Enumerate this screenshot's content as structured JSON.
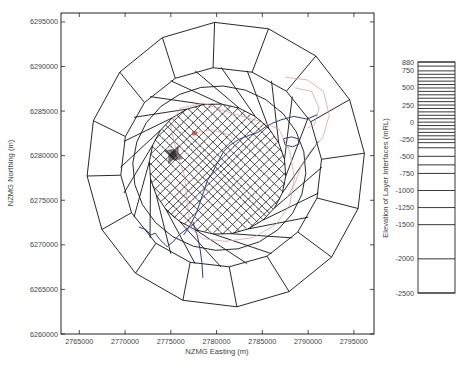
{
  "chart_data": [
    {
      "type": "mesh-map",
      "title": "",
      "xlabel": "NZMG Easting (m)",
      "ylabel": "NZMG Northing (m)",
      "xlim": [
        2763000,
        2797200
      ],
      "ylim": [
        6260000,
        6296000
      ],
      "xticks": [
        2765000,
        2770000,
        2775000,
        2780000,
        2785000,
        2790000,
        2795000
      ],
      "xtick_labels": [
        "2765000",
        "2770000",
        "2775000",
        "2780000",
        "2785000",
        "2790000",
        "2795000"
      ],
      "yticks": [
        6260000,
        6265000,
        6270000,
        6275000,
        6280000,
        6285000,
        6290000,
        6295000
      ],
      "ytick_labels": [
        "6260000",
        "6265000",
        "6270000",
        "6275000",
        "6280000",
        "6285000",
        "6290000",
        "6295000"
      ],
      "grid": false,
      "mesh": {
        "description": "Finite-element mesh: radial/elliptical rings of quadrilateral elements refining toward a central elongated zone",
        "center": [
          2781000,
          6277500
        ],
        "ellipse_rings": [
          {
            "rx": 15200,
            "ry": 16000,
            "rotation_deg": 0,
            "dx": 0,
            "dy": 1500
          },
          {
            "rx": 11000,
            "ry": 11200,
            "rotation_deg": 0,
            "dx": -500,
            "dy": 1200
          },
          {
            "rx": 7600,
            "ry": 7200,
            "rotation_deg": -35,
            "dx": -900,
            "dy": 1000
          },
          {
            "rx": 6200,
            "ry": 5000,
            "rotation_deg": -40,
            "dx": -600,
            "dy": 600
          }
        ],
        "outer_radial_spokes": 16,
        "inner_grid_divisions": 22,
        "refinement_spots": [
          {
            "x": 2775300,
            "y": 6280100,
            "label": "dense-cluster"
          }
        ]
      },
      "overlays": [
        {
          "name": "rivers",
          "color": "#2c3a8c",
          "paths": [
            [
              [
                2787000,
                6284000
              ],
              [
                2786000,
                6283600
              ],
              [
                2785300,
                6283200
              ],
              [
                2784500,
                6282600
              ],
              [
                2783600,
                6282300
              ],
              [
                2782400,
                6281800
              ],
              [
                2781500,
                6281200
              ],
              [
                2780800,
                6280500
              ],
              [
                2780200,
                6279400
              ],
              [
                2779600,
                6278200
              ],
              [
                2779000,
                6277200
              ],
              [
                2778600,
                6276000
              ],
              [
                2778200,
                6274800
              ],
              [
                2777800,
                6273600
              ],
              [
                2777400,
                6272800
              ],
              [
                2777000,
                6272000
              ],
              [
                2776400,
                6271100
              ]
            ],
            [
              [
                2787000,
                6284000
              ],
              [
                2788400,
                6284400
              ],
              [
                2789900,
                6284100
              ],
              [
                2791000,
                6284600
              ]
            ],
            [
              [
                2777000,
                6272000
              ],
              [
                2776000,
                6271200
              ],
              [
                2775200,
                6270300
              ],
              [
                2774600,
                6269800
              ],
              [
                2773800,
                6270600
              ],
              [
                2773300,
                6271300
              ],
              [
                2772800,
                6271100
              ],
              [
                2772300,
                6271700
              ],
              [
                2771500,
                6272000
              ]
            ],
            [
              [
                2777400,
                6272600
              ],
              [
                2777900,
                6271000
              ],
              [
                2778200,
                6269500
              ],
              [
                2778400,
                6268000
              ],
              [
                2778500,
                6266300
              ]
            ]
          ]
        },
        {
          "name": "lake",
          "color": "#2c3a8c",
          "paths": [
            [
              [
                2787300,
                6281900
              ],
              [
                2788200,
                6282100
              ],
              [
                2788900,
                6281900
              ],
              [
                2789000,
                6281300
              ],
              [
                2788300,
                6281000
              ],
              [
                2787500,
                6281200
              ],
              [
                2787300,
                6281900
              ]
            ]
          ]
        },
        {
          "name": "contours",
          "color": "#d79a9a",
          "paths": [
            [
              [
                2776000,
                6285300
              ],
              [
                2778500,
                6285900
              ],
              [
                2781500,
                6284800
              ],
              [
                2784600,
                6283900
              ],
              [
                2786800,
                6283000
              ],
              [
                2788000,
                6280500
              ],
              [
                2788500,
                6277500
              ],
              [
                2788000,
                6274500
              ],
              [
                2786500,
                6272300
              ],
              [
                2784000,
                6270800
              ],
              [
                2781000,
                6270400
              ],
              [
                2778500,
                6270700
              ],
              [
                2777200,
                6271800
              ],
              [
                2776800,
                6274600
              ],
              [
                2776500,
                6277700
              ],
              [
                2775600,
                6280500
              ],
              [
                2775000,
                6283300
              ],
              [
                2776000,
                6285300
              ]
            ],
            [
              [
                2787500,
                6288800
              ],
              [
                2789900,
                6288500
              ],
              [
                2791700,
                6287200
              ],
              [
                2792300,
                6284500
              ],
              [
                2791600,
                6282000
              ],
              [
                2790300,
                6280600
              ],
              [
                2789300,
                6279000
              ],
              [
                2788600,
                6277000
              ],
              [
                2787700,
                6275300
              ]
            ],
            [
              [
                2788600,
                6287600
              ],
              [
                2790400,
                6287200
              ],
              [
                2791200,
                6285300
              ],
              [
                2790700,
                6283500
              ],
              [
                2789900,
                6283100
              ]
            ],
            [
              [
                2777800,
                6282600
              ],
              [
                2779500,
                6282900
              ],
              [
                2781500,
                6282300
              ],
              [
                2782200,
                6281500
              ]
            ]
          ]
        },
        {
          "name": "source-marker",
          "color": "#d04040",
          "points": [
            [
              2777600,
              6282500
            ]
          ]
        }
      ]
    },
    {
      "type": "layer-bar",
      "ylabel": "Elevation of Layer Interfaces (mRL)",
      "ylim": [
        -2500,
        880
      ],
      "tick_labels": [
        "880",
        "750",
        "500",
        "250",
        "0",
        "-250",
        "-500",
        "-750",
        "-1000",
        "-1250",
        "-1500",
        "-2000",
        "-2500"
      ],
      "ticks": [
        880,
        750,
        500,
        250,
        0,
        -250,
        -500,
        -750,
        -1000,
        -1250,
        -1500,
        -2000,
        -2500
      ],
      "layer_interfaces": [
        880,
        820,
        750,
        700,
        650,
        600,
        550,
        500,
        450,
        400,
        350,
        300,
        250,
        200,
        150,
        100,
        50,
        0,
        -50,
        -100,
        -150,
        -200,
        -250,
        -300,
        -375,
        -500,
        -625,
        -750,
        -1000,
        -1250,
        -1500,
        -2000,
        -2500
      ]
    }
  ],
  "colors": {
    "axes": "#222222",
    "mesh": "#111111",
    "river": "#2c3a8c",
    "contour": "#d79a9a",
    "marker": "#d04040",
    "text": "#444444"
  }
}
